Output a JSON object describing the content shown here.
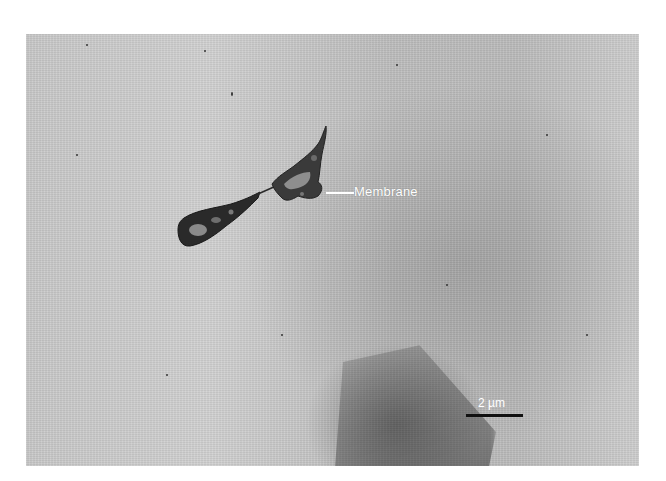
{
  "figure": {
    "type": "electron micrograph",
    "annotations": {
      "membrane_label": "Membrane",
      "scale_bar_label": "2 µm"
    },
    "colors": {
      "background": "#ffffff",
      "specimen_gray": "#c4c4c4",
      "label_text": "#ffffff",
      "scale_bar": "#111111"
    }
  }
}
